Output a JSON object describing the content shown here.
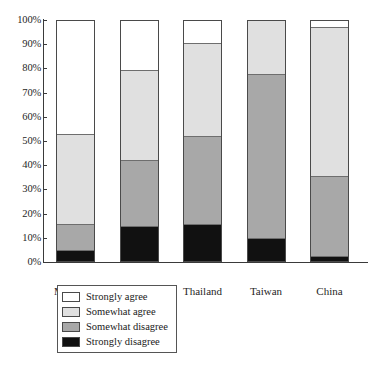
{
  "chart_data": {
    "type": "bar",
    "subtype": "stacked-100-percent",
    "title": "",
    "xlabel": "",
    "ylabel": "",
    "ylim": [
      0,
      100
    ],
    "grid": false,
    "legend_position": "bottom-left",
    "y_ticks": [
      "0%",
      "10%",
      "20%",
      "30%",
      "40%",
      "50%",
      "60%",
      "70%",
      "80%",
      "90%",
      "100%"
    ],
    "y_tick_values": [
      0,
      10,
      20,
      30,
      40,
      50,
      60,
      70,
      80,
      90,
      100
    ],
    "categories": [
      "Mongolia",
      "Philippines",
      "Thailand",
      "Taiwan",
      "China"
    ],
    "series": [
      {
        "name": "Strongly agree",
        "color": "#ffffff",
        "values": [
          47.5,
          21.0,
          9.5,
          0.0,
          3.0
        ]
      },
      {
        "name": "Somewhat agree",
        "color": "#e0e0e0",
        "values": [
          37.5,
          37.5,
          39.0,
          22.5,
          62.0
        ]
      },
      {
        "name": "Somewhat disagree",
        "color": "#a8a8a8",
        "values": [
          11.0,
          27.5,
          36.5,
          68.5,
          33.5
        ]
      },
      {
        "name": "Strongly disagree",
        "color": "#111111",
        "values": [
          4.0,
          14.0,
          15.0,
          9.0,
          1.5
        ]
      }
    ],
    "cumulative_boundaries": {
      "Mongolia": {
        "strongly_disagree_top": 4.0,
        "somewhat_disagree_top": 15.0,
        "somewhat_agree_top": 52.5,
        "strongly_agree_top": 100
      },
      "Philippines": {
        "strongly_disagree_top": 14.0,
        "somewhat_disagree_top": 41.5,
        "somewhat_agree_top": 79.0,
        "strongly_agree_top": 100
      },
      "Thailand": {
        "strongly_disagree_top": 15.0,
        "somewhat_disagree_top": 51.5,
        "somewhat_agree_top": 90.5,
        "strongly_agree_top": 100
      },
      "Taiwan": {
        "strongly_disagree_top": 9.0,
        "somewhat_disagree_top": 77.5,
        "somewhat_agree_top": 100.0,
        "strongly_agree_top": 100
      },
      "China": {
        "strongly_disagree_top": 1.5,
        "somewhat_disagree_top": 35.0,
        "somewhat_agree_top": 97.0,
        "strongly_agree_top": 100
      }
    }
  },
  "legend": {
    "items": [
      {
        "label": "Strongly agree",
        "color": "#ffffff"
      },
      {
        "label": "Somewhat agree",
        "color": "#e0e0e0"
      },
      {
        "label": "Somewhat disagree",
        "color": "#a8a8a8"
      },
      {
        "label": "Strongly disagree",
        "color": "#111111"
      }
    ]
  }
}
